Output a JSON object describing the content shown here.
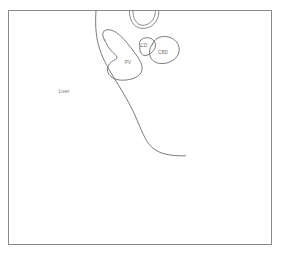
{
  "figure": {
    "background_color": "#ffffff",
    "frame": {
      "stroke_color": "#8a8a8a",
      "x": 8.5,
      "y": 10.5,
      "width": 263,
      "height": 234
    },
    "line_color": "#6b6b6b",
    "label_color": "#707070"
  },
  "labels": {
    "liver": "Liver",
    "portal_vein": "PV",
    "cystic_duct": "CD",
    "common_bile_duct": "CBD"
  },
  "structures": [
    {
      "name": "liver-border",
      "label": "Liver",
      "label_x": 64,
      "label_y": 92
    },
    {
      "name": "portal-vein",
      "label": "PV",
      "label_x": 128,
      "label_y": 63
    },
    {
      "name": "cystic-duct",
      "label": "CD",
      "label_x": 144,
      "label_y": 46
    },
    {
      "name": "common-bile-duct",
      "label": "CBD",
      "label_x": 163,
      "label_y": 53
    },
    {
      "name": "tubular-structure-top",
      "label": "",
      "label_x": 0,
      "label_y": 0
    }
  ]
}
